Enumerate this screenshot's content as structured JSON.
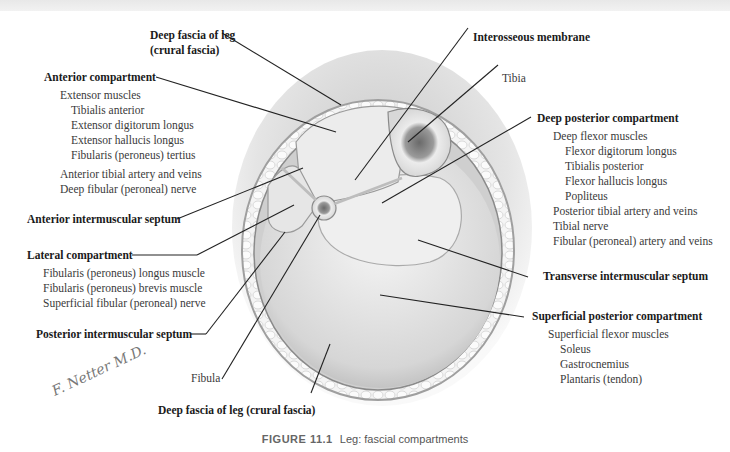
{
  "figure": {
    "number": "FIGURE 11.1",
    "title": "Leg: fascial compartments",
    "signature": "F. Netter M.D."
  },
  "labels": {
    "deep_fascia_top": {
      "line1": "Deep fascia of leg",
      "line2": "(crural fascia)"
    },
    "anterior_compartment": {
      "title": "Anterior compartment",
      "group": "Extensor muscles",
      "muscles": [
        "Tibialis anterior",
        "Extensor digitorum longus",
        "Extensor hallucis longus",
        "Fibularis (peroneus) tertius"
      ],
      "others": [
        "Anterior tibial artery and veins",
        "Deep fibular (peroneal) nerve"
      ]
    },
    "anterior_intermuscular_septum": "Anterior intermuscular septum",
    "lateral_compartment": {
      "title": "Lateral compartment",
      "items": [
        "Fibularis (peroneus) longus muscle",
        "Fibularis (peroneus) brevis muscle",
        "Superficial fibular (peroneal) nerve"
      ]
    },
    "posterior_intermuscular_septum": "Posterior intermuscular septum",
    "fibula": "Fibula",
    "deep_fascia_bottom": "Deep fascia of leg (crural fascia)",
    "interosseous_membrane": "Interosseous membrane",
    "tibia": "Tibia",
    "deep_posterior_compartment": {
      "title": "Deep posterior compartment",
      "group": "Deep flexor muscles",
      "muscles": [
        "Flexor digitorum longus",
        "Tibialis posterior",
        "Flexor hallucis longus",
        "Popliteus"
      ],
      "others": [
        "Posterior tibial artery and veins",
        "Tibial nerve",
        "Fibular (peroneal) artery and veins"
      ]
    },
    "transverse_intermuscular_septum": "Transverse intermuscular septum",
    "superficial_posterior_compartment": {
      "title": "Superficial posterior compartment",
      "group": "Superficial flexor muscles",
      "muscles": [
        "Soleus",
        "Gastrocnemius",
        "Plantaris (tendon)"
      ]
    }
  }
}
